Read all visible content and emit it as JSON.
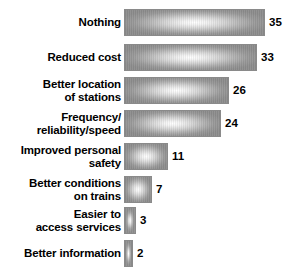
{
  "chart_data": {
    "type": "bar",
    "orientation": "horizontal",
    "title": "",
    "xlabel": "",
    "ylabel": "",
    "grid": false,
    "legend": false,
    "xlim": [
      0,
      35
    ],
    "categories": [
      "Nothing",
      "Reduced cost",
      "Better location\nof stations",
      "Frequency/\nreliability/speed",
      "Improved personal\nsafety",
      "Better conditions\non trains",
      "Easier to\naccess services",
      "Better information"
    ],
    "values": [
      35,
      33,
      26,
      24,
      11,
      7,
      3,
      2
    ],
    "value_labels": [
      "35",
      "33",
      "26",
      "24",
      "11",
      "7",
      "3",
      "2"
    ],
    "bars": [
      {
        "label": "Nothing",
        "value": 35,
        "value_label": "35"
      },
      {
        "label": "Reduced cost",
        "value": 33,
        "value_label": "33"
      },
      {
        "label": "Better location\nof stations",
        "value": 26,
        "value_label": "26"
      },
      {
        "label": "Frequency/\nreliability/speed",
        "value": 24,
        "value_label": "24"
      },
      {
        "label": "Improved personal\nsafety",
        "value": 11,
        "value_label": "11"
      },
      {
        "label": "Better conditions\non trains",
        "value": 7,
        "value_label": "7"
      },
      {
        "label": "Easier to\naccess services",
        "value": 3,
        "value_label": "3"
      },
      {
        "label": "Better information",
        "value": 2,
        "value_label": "2"
      }
    ],
    "colors": {
      "bar_fill_center": "#ffffff",
      "bar_fill_edge": "#8e8e8e",
      "bar_border": "#8a8a8a",
      "text": "#000000",
      "background": "#ffffff"
    }
  },
  "layout": {
    "bar_start_x": 127,
    "bar_height": 27,
    "row_tops": [
      9,
      44,
      77,
      110,
      143,
      176,
      207,
      240
    ],
    "px_per_unit": 4.03,
    "min_bar_px": 9
  }
}
